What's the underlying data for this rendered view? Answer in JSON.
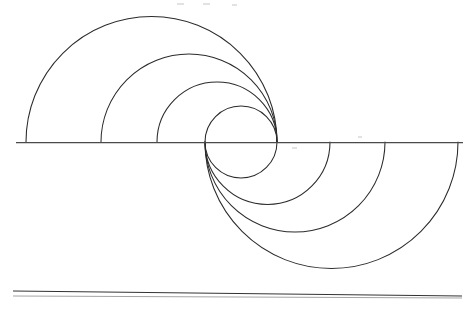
{
  "document": {
    "title": "Spiral Arc Construction",
    "background_color": "#ffffff",
    "ink_color": "#2b2b2b",
    "width": 475,
    "height": 310
  },
  "chart_data": {
    "type": "diagram",
    "subtitle": "Nested semicircles on a common baseline forming a vortex",
    "xlabel": "",
    "ylabel": "",
    "grid": false,
    "legend": false,
    "baseline": {
      "name": "horizontal baseline",
      "y": 142,
      "x_start": 16,
      "x_end": 463,
      "color": "#4a4a4a"
    },
    "convergence_points": [
      {
        "name": "upper-arc convergence",
        "x": 277,
        "y": 142
      },
      {
        "name": "lower-arc convergence",
        "x": 205,
        "y": 142
      }
    ],
    "upper_arcs": [
      {
        "index": 1,
        "left_x": 26,
        "right_x": 277,
        "center_x": 151.5,
        "radius": 125.5,
        "apex_y": 16.5
      },
      {
        "index": 2,
        "left_x": 101,
        "right_x": 277,
        "center_x": 189.0,
        "radius": 88.0,
        "apex_y": 54.0
      },
      {
        "index": 3,
        "left_x": 157,
        "right_x": 277,
        "center_x": 217.0,
        "radius": 60.0,
        "apex_y": 82.0
      },
      {
        "index": 4,
        "left_x": 205,
        "right_x": 277,
        "center_x": 241.0,
        "radius": 36.0,
        "apex_y": 106.0
      }
    ],
    "lower_arcs": [
      {
        "index": 1,
        "left_x": 205,
        "right_x": 277,
        "center_x": 241.0,
        "radius": 36.0,
        "nadir_y": 178.0
      },
      {
        "index": 2,
        "left_x": 205,
        "right_x": 330,
        "center_x": 267.5,
        "radius": 62.5,
        "nadir_y": 204.5
      },
      {
        "index": 3,
        "left_x": 205,
        "right_x": 385,
        "center_x": 295.0,
        "radius": 90.0,
        "nadir_y": 232.0
      },
      {
        "index": 4,
        "left_x": 205,
        "right_x": 458,
        "center_x": 331.5,
        "radius": 126.5,
        "nadir_y": 268.5
      }
    ],
    "inner_circle": {
      "center_x": 241,
      "center_y": 142,
      "radius": 36,
      "note": "formed by upper arc 4 and lower arc 1"
    },
    "base_rules": [
      {
        "index": 1,
        "x1": 13,
        "y1": 291,
        "x2": 462,
        "y2": 296
      },
      {
        "index": 2,
        "x1": 13,
        "y1": 296,
        "x2": 462,
        "y2": 298
      }
    ],
    "specks": [
      {
        "x": 177,
        "y": 3,
        "w": 7,
        "h": 2
      },
      {
        "x": 203,
        "y": 3,
        "w": 7,
        "h": 2
      },
      {
        "x": 232,
        "y": 4,
        "w": 5,
        "h": 2
      },
      {
        "x": 358,
        "y": 136,
        "w": 4,
        "h": 2
      },
      {
        "x": 292,
        "y": 147,
        "w": 5,
        "h": 2
      }
    ]
  }
}
